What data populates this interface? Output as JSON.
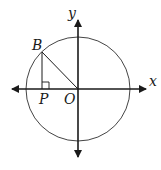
{
  "diagram": {
    "type": "unit-circle-triangle",
    "labels": {
      "x_axis": "x",
      "y_axis": "y",
      "point_B": "B",
      "point_P": "P",
      "point_O": "O"
    },
    "colors": {
      "stroke": "#1a1a1a",
      "circle": "#444444",
      "background": "#ffffff"
    },
    "elements": [
      "x-axis with arrows",
      "y-axis with arrows",
      "circle centered at O",
      "segment OB",
      "segment BP perpendicular to x-axis",
      "right-angle mark at P"
    ]
  }
}
